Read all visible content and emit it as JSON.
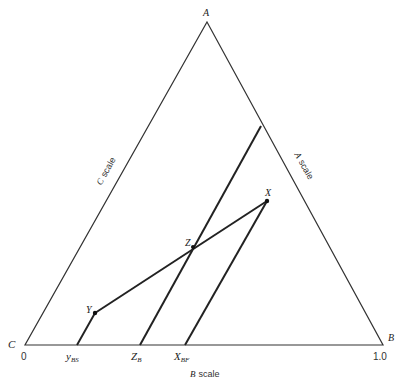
{
  "diagram": {
    "type": "ternary-diagram",
    "vertices": {
      "A": {
        "label": "A",
        "x": 207,
        "y": 22
      },
      "B": {
        "label": "B",
        "x": 383,
        "y": 345
      },
      "C": {
        "label": "C",
        "x": 25,
        "y": 345
      }
    },
    "points": {
      "X": {
        "label": "X",
        "x": 267,
        "y": 201
      },
      "Y": {
        "label": "Y",
        "x": 95,
        "y": 313
      },
      "Z": {
        "label": "Z",
        "x": 193,
        "y": 247
      }
    },
    "axis": {
      "start_label": "0",
      "end_label": "1.0",
      "ticks": [
        {
          "label": "y",
          "sub": "BS",
          "x": 77
        },
        {
          "label": "Z",
          "sub": "B",
          "x": 140
        },
        {
          "label": "X",
          "sub": "BF",
          "x": 185
        }
      ]
    },
    "scales": {
      "a_scale_letter": "A",
      "b_scale_letter": "B",
      "c_scale_letter": "C",
      "scale_word": "scale"
    }
  }
}
